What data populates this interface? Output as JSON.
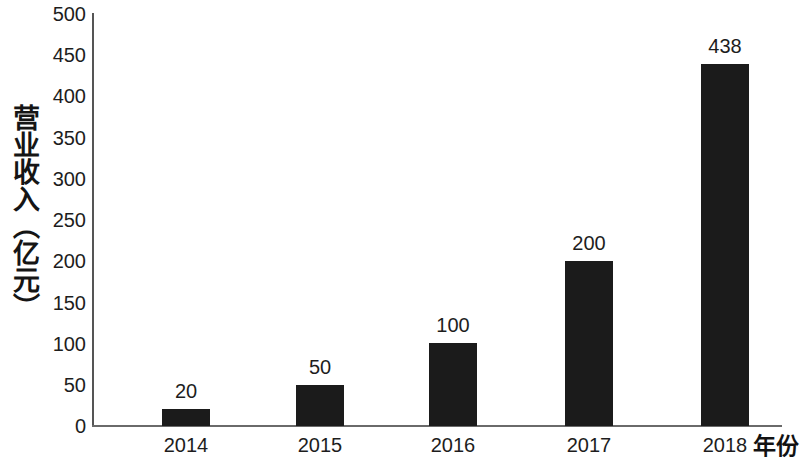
{
  "chart_data": {
    "type": "bar",
    "title": "",
    "subtitle": "",
    "categories": [
      "2014",
      "2015",
      "2016",
      "2017",
      "2018"
    ],
    "values": [
      20,
      50,
      100,
      200,
      438
    ],
    "data_labels": [
      "20",
      "50",
      "100",
      "200",
      "438"
    ],
    "series": [
      {
        "name": "营业收入（亿元）",
        "values": [
          20,
          50,
          100,
          200,
          438
        ]
      }
    ],
    "xlabel": "年份",
    "ylabel": "营业收入（亿元）",
    "ylim": [
      0,
      500
    ],
    "ytick_interval": 50,
    "yticks": [
      "500",
      "450",
      "400",
      "350",
      "300",
      "250",
      "200",
      "150",
      "100",
      "50",
      "0"
    ],
    "ytick_values": [
      500,
      450,
      400,
      350,
      300,
      250,
      200,
      150,
      100,
      50,
      0
    ],
    "xticks": [
      "2014",
      "2015",
      "2016",
      "2017",
      "2018"
    ],
    "grid": false,
    "legend": false,
    "legend_position": "none",
    "bar_color": "#1b1b1b",
    "axis_color": "#5f5f5f",
    "text_color": "#1d1d1d",
    "background_color": "#ffffff"
  }
}
